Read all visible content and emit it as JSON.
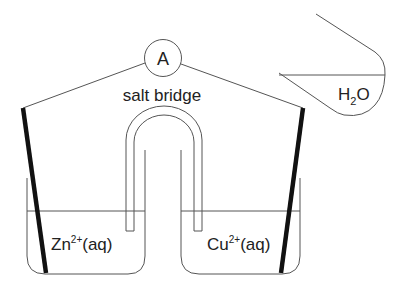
{
  "diagram": {
    "ammeter": {
      "label": "A"
    },
    "salt_bridge": {
      "label": "salt bridge"
    },
    "left_cell": {
      "solution_label": "Zn",
      "solution_charge": "2+",
      "solution_state": "(aq)",
      "electrode": "zinc-electrode"
    },
    "right_cell": {
      "solution_label": "Cu",
      "solution_charge": "2+",
      "solution_state": "(aq)",
      "electrode": "copper-electrode"
    },
    "water_beaker": {
      "label_main": "H",
      "label_sub": "2",
      "label_end": "O"
    },
    "colors": {
      "line": "#555555",
      "electrode": "#111111",
      "text": "#222222",
      "background": "#ffffff"
    }
  }
}
